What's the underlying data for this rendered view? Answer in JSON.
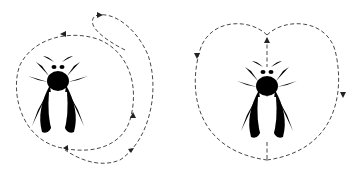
{
  "figure": {
    "panels": [
      {
        "id": "round-dance",
        "description": "Round dance: bee with circular dashed path and reversal loop"
      },
      {
        "id": "waggle-dance",
        "description": "Figure-eight dance: bee centered on straight run with two lobes"
      }
    ],
    "colors": {
      "line": "#333333",
      "background": "#ffffff",
      "thorax": "#cfcfcf"
    }
  }
}
